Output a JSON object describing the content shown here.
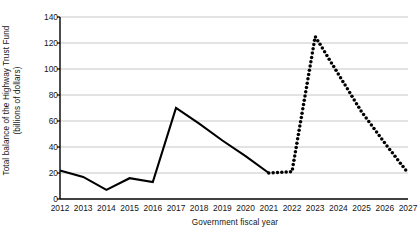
{
  "chart_data": {
    "type": "line",
    "title": "",
    "xlabel": "Government fiscal year",
    "ylabel": "Total balance of the Highway Trust Fund (billions of dollars)",
    "ylabel_line1": "Total balance of the Highway Trust Fund",
    "ylabel_line2": "(billions of dollars)",
    "x": [
      2012,
      2013,
      2014,
      2015,
      2016,
      2017,
      2018,
      2019,
      2020,
      2021,
      2022,
      2023,
      2024,
      2025,
      2026,
      2027
    ],
    "categories": [
      "2012",
      "2013",
      "2014",
      "2015",
      "2016",
      "2017",
      "2018",
      "2019",
      "2020",
      "2021",
      "2022",
      "2023",
      "2024",
      "2025",
      "2026",
      "2027"
    ],
    "xlim": [
      2012,
      2027
    ],
    "ylim": [
      0,
      140
    ],
    "yticks": [
      0,
      20,
      40,
      60,
      80,
      100,
      120,
      140
    ],
    "ytick_labels": [
      "0",
      "20",
      "40",
      "60",
      "80",
      "100",
      "120",
      "140"
    ],
    "grid": true,
    "grid_axis": "y",
    "grid_color": "#b8b8b8",
    "legend": "none",
    "series": [
      {
        "name": "Actual",
        "style": "solid",
        "color": "#000000",
        "x": [
          2012,
          2013,
          2014,
          2015,
          2016,
          2017,
          2018,
          2019,
          2020,
          2021
        ],
        "values": [
          22,
          17,
          7,
          16,
          13,
          70,
          58,
          45,
          33,
          20
        ]
      },
      {
        "name": "Projected",
        "style": "dotted",
        "color": "#000000",
        "x": [
          2021,
          2022,
          2023,
          2024,
          2025,
          2026,
          2027
        ],
        "values": [
          20,
          21,
          125,
          96,
          67,
          43,
          20
        ]
      }
    ]
  }
}
